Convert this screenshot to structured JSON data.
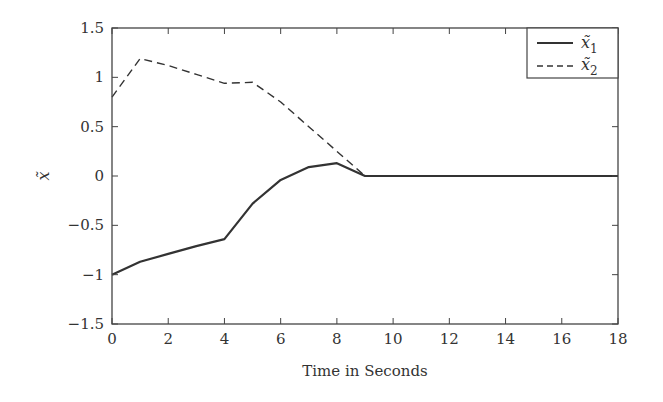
{
  "chart_data": {
    "type": "line",
    "title": "",
    "xlabel": "Time in Seconds",
    "ylabel": "x̃",
    "xlim": [
      0,
      18
    ],
    "ylim": [
      -1.5,
      1.5
    ],
    "xticks": [
      "0",
      "2",
      "4",
      "6",
      "8",
      "10",
      "12",
      "14",
      "16",
      "18"
    ],
    "yticks": [
      "1.5",
      "1",
      "0.5",
      "0",
      "−0.5",
      "−1",
      "−1.5"
    ],
    "grid": false,
    "legend_position": "upper right",
    "series": [
      {
        "name": "x̃₁",
        "label": "x̃",
        "subscript": "1",
        "style": "solid",
        "x": [
          0,
          1,
          2,
          3,
          4,
          5,
          6,
          7,
          8,
          9,
          10,
          12,
          14,
          16,
          18
        ],
        "y": [
          -1.0,
          -0.87,
          -0.79,
          -0.71,
          -0.64,
          -0.28,
          -0.04,
          0.09,
          0.13,
          0.0,
          0.0,
          0.0,
          0.0,
          0.0,
          0.0
        ]
      },
      {
        "name": "x̃₂",
        "label": "x̃",
        "subscript": "2",
        "style": "dashed",
        "x": [
          0,
          1,
          2,
          3,
          4,
          5,
          6,
          7,
          8,
          9
        ],
        "y": [
          0.8,
          1.19,
          1.12,
          1.03,
          0.94,
          0.95,
          0.75,
          0.5,
          0.25,
          0.0
        ]
      }
    ]
  }
}
